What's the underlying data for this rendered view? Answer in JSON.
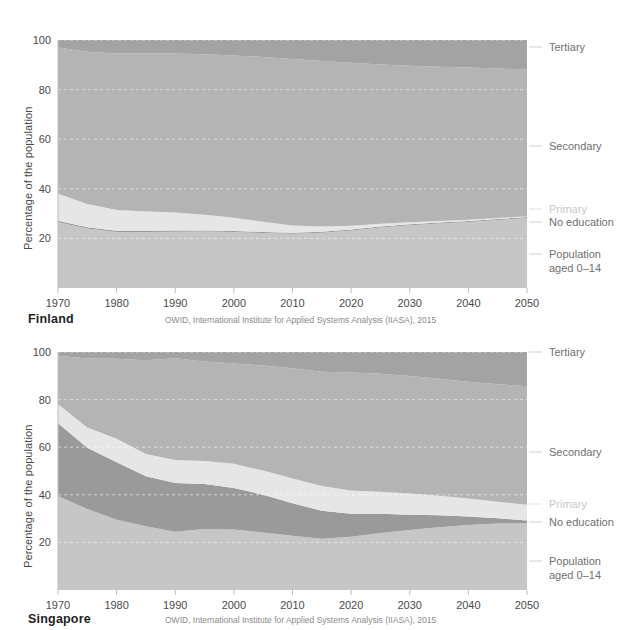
{
  "page": {
    "background": "#ffffff",
    "width": 631,
    "height": 630
  },
  "palette": {
    "no_education": "#9a9a9a",
    "primary": "#e6e6e6",
    "secondary": "#b4b4b4",
    "tertiary": "#a3a3a3",
    "population_0_14": "#c6c6c6",
    "axis_text": "#4a4a4a",
    "legend_text": "#6f6f6f",
    "legend_faint_text": "#c9c9c9",
    "gridline": "#f2f2f2",
    "axis_line": "#bdbdbd",
    "country_text": "#1f1f1f",
    "source_text": "#8a8a8a"
  },
  "legend": {
    "items": [
      {
        "key": "tertiary",
        "label": "Tertiary",
        "faded": false
      },
      {
        "key": "secondary",
        "label": "Secondary",
        "faded": false
      },
      {
        "key": "primary",
        "label": "Primary",
        "faded": true
      },
      {
        "key": "no_education",
        "label": "No education",
        "faded": false
      },
      {
        "key": "population_0_14",
        "label_line1": "Population",
        "label_line2": "aged 0–14",
        "faded": false
      }
    ]
  },
  "charts": [
    {
      "id": "finland",
      "country": "Finland",
      "source": "OWID, International Institute for Applied Systems Analysis (IIASA), 2015",
      "ylabel": "Percentage of the population",
      "ylim": [
        0,
        100
      ],
      "yticks": [
        20,
        40,
        60,
        80,
        100
      ],
      "ytick_labels": [
        "20",
        "40",
        "60",
        "80",
        "100"
      ],
      "xlim": [
        1970,
        2050
      ],
      "xticks": [
        1970,
        1980,
        1990,
        2000,
        2010,
        2020,
        2030,
        2040,
        2050
      ],
      "xtick_labels": [
        "1970",
        "1980",
        "1990",
        "2000",
        "2010",
        "2020",
        "2030",
        "2040",
        "2050"
      ],
      "chart_data": {
        "type": "area",
        "title": "Finland",
        "xlabel": "",
        "ylabel": "Percentage of the population",
        "ylim": [
          0,
          100
        ],
        "xlim": [
          1970,
          2050
        ],
        "grid": true,
        "legend_position": "right",
        "stacked": true,
        "x": [
          1970,
          1975,
          1980,
          1985,
          1990,
          1995,
          2000,
          2005,
          2010,
          2015,
          2020,
          2025,
          2030,
          2035,
          2040,
          2045,
          2050
        ],
        "series": [
          {
            "name": "Population aged 0–14",
            "color": "#c6c6c6",
            "values": [
              26.5,
              24.0,
              22.6,
              22.6,
              22.7,
              22.8,
              22.6,
              22.2,
              21.9,
              22.3,
              23.2,
              24.4,
              25.3,
              26.0,
              26.6,
              27.4,
              28.2
            ]
          },
          {
            "name": "No education",
            "color": "#9a9a9a",
            "values": [
              0.6,
              0.5,
              0.5,
              0.5,
              0.5,
              0.4,
              0.4,
              0.4,
              0.4,
              0.4,
              0.4,
              0.4,
              0.4,
              0.4,
              0.4,
              0.4,
              0.4
            ]
          },
          {
            "name": "Primary",
            "color": "#e6e6e6",
            "values": [
              10.9,
              9.4,
              8.4,
              7.7,
              7.2,
              6.3,
              5.3,
              4.1,
              2.9,
              2.1,
              1.5,
              1.1,
              0.8,
              0.6,
              0.5,
              0.4,
              0.3
            ]
          },
          {
            "name": "Secondary",
            "color": "#b4b4b4",
            "values": [
              59.0,
              61.4,
              63.1,
              63.8,
              64.2,
              64.8,
              65.5,
              66.4,
              67.1,
              66.7,
              65.7,
              64.2,
              63.1,
              62.2,
              61.4,
              60.3,
              59.2
            ]
          },
          {
            "name": "Tertiary",
            "color": "#a3a3a3",
            "values": [
              3.0,
              4.7,
              5.4,
              5.4,
              5.4,
              5.7,
              6.2,
              6.9,
              7.7,
              8.5,
              9.2,
              9.9,
              10.4,
              10.8,
              11.1,
              11.5,
              11.9
            ]
          }
        ]
      }
    },
    {
      "id": "singapore",
      "country": "Singapore",
      "source": "OWID, International Institute for Applied Systems Analysis (IIASA), 2015",
      "ylabel": "Percentage of the population",
      "ylim": [
        0,
        100
      ],
      "yticks": [
        20,
        40,
        60,
        80,
        100
      ],
      "ytick_labels": [
        "20",
        "40",
        "60",
        "80",
        "100"
      ],
      "xlim": [
        1970,
        2050
      ],
      "xticks": [
        1970,
        1980,
        1990,
        2000,
        2010,
        2020,
        2030,
        2040,
        2050
      ],
      "xtick_labels": [
        "1970",
        "1980",
        "1990",
        "2000",
        "2010",
        "2020",
        "2030",
        "2040",
        "2050"
      ],
      "chart_data": {
        "type": "area",
        "title": "Singapore",
        "xlabel": "",
        "ylabel": "Percentage of the population",
        "ylim": [
          0,
          100
        ],
        "xlim": [
          1970,
          2050
        ],
        "grid": true,
        "legend_position": "right",
        "stacked": true,
        "x": [
          1970,
          1975,
          1980,
          1985,
          1990,
          1995,
          2000,
          2005,
          2010,
          2015,
          2020,
          2025,
          2030,
          2035,
          2040,
          2045,
          2050
        ],
        "series": [
          {
            "name": "Population aged 0–14",
            "color": "#c6c6c6",
            "values": [
              39.5,
              34.0,
              29.5,
              26.8,
              24.5,
              25.6,
              25.4,
              24.2,
              22.8,
              21.5,
              22.4,
              24.0,
              25.2,
              26.4,
              27.3,
              27.9,
              28.0
            ]
          },
          {
            "name": "No education",
            "color": "#9a9a9a",
            "values": [
              30.6,
              25.8,
              24.2,
              21.0,
              20.5,
              18.9,
              17.5,
              15.8,
              13.7,
              11.8,
              9.6,
              8.0,
              6.4,
              5.0,
              3.6,
              2.2,
              1.2
            ]
          },
          {
            "name": "Primary",
            "color": "#e6e6e6",
            "values": [
              7.9,
              8.5,
              9.8,
              9.3,
              9.6,
              9.7,
              10.1,
              10.2,
              10.3,
              10.4,
              9.8,
              9.3,
              8.9,
              8.2,
              7.5,
              7.0,
              6.6
            ]
          },
          {
            "name": "Secondary",
            "color": "#b4b4b4",
            "values": [
              20.4,
              29.0,
              33.7,
              39.4,
              42.8,
              41.8,
              42.2,
              44.1,
              46.4,
              48.0,
              49.6,
              49.6,
              49.4,
              49.2,
              49.1,
              49.4,
              49.8
            ]
          },
          {
            "name": "Tertiary",
            "color": "#a3a3a3",
            "values": [
              1.6,
              2.7,
              2.8,
              3.5,
              2.6,
              4.0,
              4.8,
              5.7,
              6.8,
              8.3,
              8.6,
              9.1,
              10.1,
              11.2,
              12.5,
              13.5,
              14.4
            ]
          }
        ]
      }
    }
  ]
}
